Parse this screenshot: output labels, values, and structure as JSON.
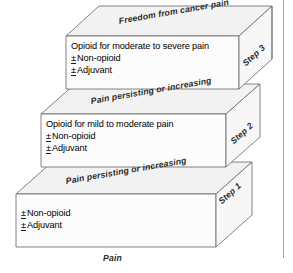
{
  "diagram": {
    "axis_label": "Pain",
    "steps": [
      {
        "id": "step-1",
        "side_label": "Step 1",
        "top_band_label": "Pain persisting or increasing",
        "lines": [
          {
            "prefix": "±",
            "text": "Non-opioid"
          },
          {
            "prefix": "±",
            "text": "Adjuvant"
          }
        ]
      },
      {
        "id": "step-2",
        "side_label": "Step 2",
        "top_band_label": "Pain persisting or increasing",
        "lines": [
          {
            "prefix": "",
            "text": "Opioid for mild to moderate pain"
          },
          {
            "prefix": "±",
            "text": "Non-opioid"
          },
          {
            "prefix": "±",
            "text": "Adjuvant"
          }
        ]
      },
      {
        "id": "step-3",
        "side_label": "Step 3",
        "top_band_label": "Freedom from cancer pain",
        "lines": [
          {
            "prefix": "",
            "text": "Opioid for moderate to severe pain"
          },
          {
            "prefix": "±",
            "text": "Non-opioid"
          },
          {
            "prefix": "±",
            "text": "Adjuvant"
          }
        ]
      }
    ],
    "colors": {
      "outline": "#555555",
      "face_fill": "#fbfbfb",
      "top_fill": "#f2f2f2",
      "side_fill": "#f6f6f6",
      "text": "#1a1a1a",
      "background": "#ffffff"
    }
  }
}
